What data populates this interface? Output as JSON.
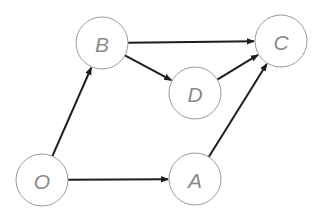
{
  "diagram": {
    "type": "directed-graph",
    "node_style": {
      "radius": 26,
      "stroke_color": "#9a9a9a",
      "fill_color": "#ffffff",
      "label_color": "#8a8a8a"
    },
    "edge_color": "#1e1e1e",
    "nodes": [
      {
        "id": "O",
        "label": "O",
        "cx": 42,
        "cy": 180
      },
      {
        "id": "A",
        "label": "A",
        "cx": 195,
        "cy": 179
      },
      {
        "id": "B",
        "label": "B",
        "cx": 102,
        "cy": 43
      },
      {
        "id": "C",
        "label": "C",
        "cx": 281,
        "cy": 41
      },
      {
        "id": "D",
        "label": "D",
        "cx": 195,
        "cy": 93
      }
    ],
    "edges": [
      {
        "from": "O",
        "to": "A"
      },
      {
        "from": "O",
        "to": "B"
      },
      {
        "from": "B",
        "to": "C"
      },
      {
        "from": "B",
        "to": "D"
      },
      {
        "from": "D",
        "to": "C"
      },
      {
        "from": "A",
        "to": "C"
      }
    ]
  }
}
